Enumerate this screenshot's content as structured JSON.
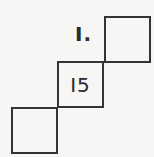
{
  "puzzle": {
    "number_label": "I.",
    "cells": [
      {
        "position": "top-right",
        "value": ""
      },
      {
        "position": "middle",
        "value": "I5"
      },
      {
        "position": "bottom-left",
        "value": ""
      }
    ]
  }
}
